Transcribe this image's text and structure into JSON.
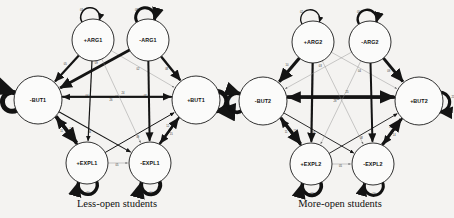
{
  "figure": {
    "background_color": "#f4f3f1",
    "ink_color": "#141414",
    "node_fill": "#fbfbfa",
    "light_edge_color": "#8e8e8e"
  },
  "panels": [
    {
      "id": "less-open",
      "caption": "Less-open students",
      "caption_x": 117,
      "caption_y": 203,
      "nodes": [
        {
          "id": "pARG1",
          "label": "+ARG1",
          "cx": 93,
          "cy": 40,
          "r": 21
        },
        {
          "id": "nARG1",
          "label": "-ARG1",
          "cx": 148,
          "cy": 40,
          "r": 21
        },
        {
          "id": "nBUT1",
          "label": "-BUT1",
          "cx": 38,
          "cy": 100,
          "r": 24
        },
        {
          "id": "pBUT1",
          "label": "+BUT1",
          "cx": 196,
          "cy": 100,
          "r": 24
        },
        {
          "id": "pEXPL1",
          "label": "+EXPL1",
          "cx": 87,
          "cy": 163,
          "r": 21
        },
        {
          "id": "nEXPL1",
          "label": "-EXPL1",
          "cx": 150,
          "cy": 163,
          "r": 21
        }
      ],
      "self_loops": [
        {
          "node": "pARG1",
          "side": "top",
          "weight": 1.6,
          "label": "03"
        },
        {
          "node": "nARG1",
          "side": "top",
          "weight": 3.0,
          "label": "08"
        },
        {
          "node": "nBUT1",
          "side": "left",
          "weight": 5.0,
          "label": "17"
        },
        {
          "node": "pBUT1",
          "side": "right",
          "weight": 4.6,
          "label": "22"
        },
        {
          "node": "pEXPL1",
          "side": "bottom",
          "weight": 3.4,
          "label": "10"
        },
        {
          "node": "nEXPL1",
          "side": "bottom",
          "weight": 3.8,
          "label": "14"
        }
      ],
      "edges": [
        {
          "from": "pARG1",
          "to": "nBUT1",
          "weight": 2.2,
          "label": "05",
          "style": "solid"
        },
        {
          "from": "pARG1",
          "to": "pEXPL1",
          "weight": 1.2,
          "label": "04",
          "style": "solid"
        },
        {
          "from": "pARG1",
          "to": "pBUT1",
          "weight": 0.5,
          "label": "02",
          "style": "light"
        },
        {
          "from": "nARG1",
          "to": "pBUT1",
          "weight": 2.4,
          "label": "08",
          "style": "solid"
        },
        {
          "from": "nARG1",
          "to": "nEXPL1",
          "weight": 2.0,
          "label": "07",
          "style": "solid"
        },
        {
          "from": "nARG1",
          "to": "nBUT1",
          "weight": 2.8,
          "label": "09",
          "style": "solid"
        },
        {
          "from": "nBUT1",
          "to": "pBUT1",
          "weight": 1.9,
          "label": "26",
          "style": "solid"
        },
        {
          "from": "pBUT1",
          "to": "nBUT1",
          "weight": 1.6,
          "label": "24",
          "style": "solid"
        },
        {
          "from": "nBUT1",
          "to": "pEXPL1",
          "weight": 3.6,
          "label": "11",
          "style": "solid"
        },
        {
          "from": "pEXPL1",
          "to": "nBUT1",
          "weight": 2.6,
          "label": "13",
          "style": "solid"
        },
        {
          "from": "pBUT1",
          "to": "nEXPL1",
          "weight": 2.0,
          "label": "12",
          "style": "solid"
        },
        {
          "from": "nEXPL1",
          "to": "pBUT1",
          "weight": 2.4,
          "label": "15",
          "style": "solid"
        },
        {
          "from": "nBUT1",
          "to": "nEXPL1",
          "weight": 1.1,
          "label": "06",
          "style": "solid"
        },
        {
          "from": "pEXPL1",
          "to": "pBUT1",
          "weight": 1.0,
          "label": "09",
          "style": "solid"
        },
        {
          "from": "pEXPL1",
          "to": "nEXPL1",
          "weight": 0.5,
          "label": "05",
          "style": "light"
        },
        {
          "from": "pARG1",
          "to": "nEXPL1",
          "weight": 0.45,
          "label": "01",
          "style": "light"
        }
      ]
    },
    {
      "id": "more-open",
      "caption": "More-open students",
      "caption_x": 340,
      "caption_y": 203,
      "nodes": [
        {
          "id": "pARG2",
          "label": "+ARG2",
          "cx": 313,
          "cy": 42,
          "r": 21
        },
        {
          "id": "nARG2",
          "label": "-ARG2",
          "cx": 370,
          "cy": 42,
          "r": 21
        },
        {
          "id": "nBUT2",
          "label": "-BUT2",
          "cx": 263,
          "cy": 101,
          "r": 24
        },
        {
          "id": "pBUT2",
          "label": "+BUT2",
          "cx": 419,
          "cy": 101,
          "r": 24
        },
        {
          "id": "pEXPL2",
          "label": "+EXPL2",
          "cx": 311,
          "cy": 164,
          "r": 21
        },
        {
          "id": "nEXPL2",
          "label": "-EXPL2",
          "cx": 373,
          "cy": 164,
          "r": 21
        }
      ],
      "self_loops": [
        {
          "node": "pARG2",
          "side": "top",
          "weight": 1.3,
          "label": "02"
        },
        {
          "node": "nARG2",
          "side": "top",
          "weight": 2.4,
          "label": "05"
        },
        {
          "node": "nBUT2",
          "side": "left",
          "weight": 3.6,
          "label": "19"
        },
        {
          "node": "pBUT2",
          "side": "right",
          "weight": 3.2,
          "label": "21"
        },
        {
          "node": "pEXPL2",
          "side": "bottom",
          "weight": 3.6,
          "label": "12"
        },
        {
          "node": "nEXPL2",
          "side": "bottom",
          "weight": 3.0,
          "label": "10"
        }
      ],
      "edges": [
        {
          "from": "pARG2",
          "to": "nBUT2",
          "weight": 3.2,
          "label": "10",
          "style": "solid"
        },
        {
          "from": "pARG2",
          "to": "pEXPL2",
          "weight": 2.2,
          "label": "08",
          "style": "solid"
        },
        {
          "from": "pARG2",
          "to": "pBUT2",
          "weight": 0.45,
          "label": "04",
          "style": "light"
        },
        {
          "from": "nARG2",
          "to": "pBUT2",
          "weight": 3.0,
          "label": "09",
          "style": "solid"
        },
        {
          "from": "nARG2",
          "to": "nEXPL2",
          "weight": 2.0,
          "label": "07",
          "style": "solid"
        },
        {
          "from": "nARG2",
          "to": "nBUT2",
          "weight": 0.45,
          "label": "03",
          "style": "light"
        },
        {
          "from": "nBUT2",
          "to": "pBUT2",
          "weight": 3.4,
          "label": "28",
          "style": "solid"
        },
        {
          "from": "pBUT2",
          "to": "nBUT2",
          "weight": 3.0,
          "label": "25",
          "style": "solid"
        },
        {
          "from": "nBUT2",
          "to": "pEXPL2",
          "weight": 3.2,
          "label": "11",
          "style": "solid"
        },
        {
          "from": "pEXPL2",
          "to": "nBUT2",
          "weight": 2.0,
          "label": "13",
          "style": "solid"
        },
        {
          "from": "pBUT2",
          "to": "nEXPL2",
          "weight": 2.0,
          "label": "09",
          "style": "solid"
        },
        {
          "from": "nEXPL2",
          "to": "pBUT2",
          "weight": 3.0,
          "label": "14",
          "style": "solid"
        },
        {
          "from": "nBUT2",
          "to": "nEXPL2",
          "weight": 0.9,
          "label": "06",
          "style": "solid"
        },
        {
          "from": "pEXPL2",
          "to": "pBUT2",
          "weight": 0.9,
          "label": "08",
          "style": "solid"
        },
        {
          "from": "pEXPL2",
          "to": "nEXPL2",
          "weight": 0.55,
          "label": "05",
          "style": "light"
        },
        {
          "from": "pARG2",
          "to": "nEXPL2",
          "weight": 0.45,
          "label": "02",
          "style": "light"
        },
        {
          "from": "nARG2",
          "to": "pEXPL2",
          "weight": 0.45,
          "label": "02",
          "style": "light"
        }
      ]
    }
  ]
}
